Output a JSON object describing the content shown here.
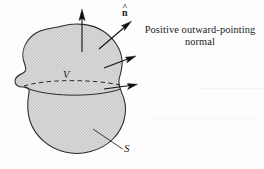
{
  "figure": {
    "kind": "vector-calculus-diagram",
    "background_color": "#fdfdfd",
    "ink_color": "#1a1a1a",
    "fill_color": "#d3d3d3",
    "fill_style": "halftone-gray"
  },
  "labels": {
    "normal_symbol": "n",
    "normal_hat": "^",
    "volume": "V",
    "surface": "S",
    "caption_line1": "Positive outward-pointing",
    "caption_line2": "normal"
  },
  "annotations": [
    {
      "name": "normal-arrow-top",
      "direction": "up",
      "from": [
        82,
        52
      ],
      "to": [
        82,
        10
      ]
    },
    {
      "name": "normal-arrow-upper-right",
      "direction": "up-right",
      "from": [
        100,
        48
      ],
      "to": [
        130,
        22
      ]
    },
    {
      "name": "normal-arrow-right-upper",
      "direction": "right-up",
      "from": [
        104,
        68
      ],
      "to": [
        135,
        56
      ]
    },
    {
      "name": "normal-arrow-right-lower",
      "direction": "right",
      "from": [
        104,
        89
      ],
      "to": [
        137,
        84
      ]
    },
    {
      "name": "surface-leader-line",
      "from": [
        93,
        129
      ],
      "to": [
        122,
        149
      ]
    }
  ],
  "geometry": {
    "volume_back_edge": "dashed-ellipse",
    "volume_front_edge": "solid-curve",
    "blob_outline": "closed-irregular-lobed"
  }
}
